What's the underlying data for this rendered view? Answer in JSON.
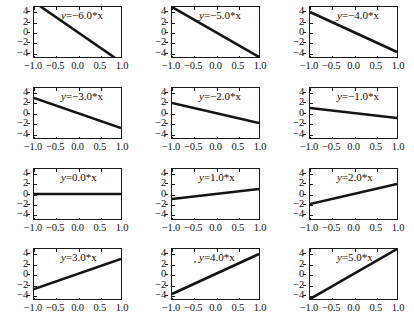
{
  "figure": {
    "rows": 4,
    "cols": 3,
    "background": "#ffffff",
    "line_color": "#141414",
    "axis_color": "#1a1a1a"
  },
  "axes_common": {
    "xlim": [
      -1.0,
      1.0
    ],
    "ylim": [
      -5.0,
      5.0
    ],
    "xticks": [
      -1.0,
      -0.5,
      0.0,
      0.5,
      1.0
    ],
    "xticklabels": [
      "-1.0",
      "-0.5",
      "0.0",
      "0.5",
      "1.0"
    ],
    "yticks": [
      -4,
      -2,
      0,
      2,
      4
    ],
    "yticklabels": [
      "-4",
      "-2",
      "0",
      "2",
      "4"
    ],
    "grid": false,
    "legend": false
  },
  "chart_data": [
    {
      "type": "line",
      "title": "y=−6.0*x",
      "label_eq_lhs": "y",
      "label_eq_op": "=",
      "label_eq_rhs": "−6.0*x",
      "slope": -6.0,
      "intercept": 0,
      "x": [
        -1.0,
        1.0
      ],
      "y": [
        6.0,
        -6.0
      ],
      "xlabel": "",
      "ylabel": "",
      "xlim": [
        -1.0,
        1.0
      ],
      "ylim": [
        -5.0,
        5.0
      ],
      "xticklabels": [
        "-1.0",
        "-0.5",
        "0.0",
        "0.5",
        "1.0"
      ],
      "yticklabels": [
        "-4",
        "-2",
        "0",
        "2",
        "4"
      ]
    },
    {
      "type": "line",
      "title": "y=−5.0*x",
      "label_eq_lhs": "y",
      "label_eq_op": "=",
      "label_eq_rhs": "−5.0*x",
      "slope": -5.0,
      "intercept": 0,
      "x": [
        -1.0,
        1.0
      ],
      "y": [
        5.0,
        -5.0
      ],
      "xlabel": "",
      "ylabel": "",
      "xlim": [
        -1.0,
        1.0
      ],
      "ylim": [
        -5.0,
        5.0
      ],
      "xticklabels": [
        "-1.0",
        "-0.5",
        "0.0",
        "0.5",
        "1.0"
      ],
      "yticklabels": [
        "-4",
        "-2",
        "0",
        "2",
        "4"
      ]
    },
    {
      "type": "line",
      "title": "y=−4.0*x",
      "label_eq_lhs": "y",
      "label_eq_op": "=",
      "label_eq_rhs": "−4.0*x",
      "slope": -4.0,
      "intercept": 0,
      "x": [
        -1.0,
        1.0
      ],
      "y": [
        4.0,
        -4.0
      ],
      "xlabel": "",
      "ylabel": "",
      "xlim": [
        -1.0,
        1.0
      ],
      "ylim": [
        -5.0,
        5.0
      ],
      "xticklabels": [
        "-1.0",
        "-0.5",
        "0.0",
        "0.5",
        "1.0"
      ],
      "yticklabels": [
        "-4",
        "-2",
        "0",
        "2",
        "4"
      ]
    },
    {
      "type": "line",
      "title": "y=−3.0*x",
      "label_eq_lhs": "y",
      "label_eq_op": "=",
      "label_eq_rhs": "−3.0*x",
      "slope": -3.0,
      "intercept": 0,
      "x": [
        -1.0,
        1.0
      ],
      "y": [
        3.0,
        -3.0
      ],
      "xlabel": "",
      "ylabel": "",
      "xlim": [
        -1.0,
        1.0
      ],
      "ylim": [
        -5.0,
        5.0
      ],
      "xticklabels": [
        "-1.0",
        "-0.5",
        "0.0",
        "0.5",
        "1.0"
      ],
      "yticklabels": [
        "-4",
        "-2",
        "0",
        "2",
        "4"
      ]
    },
    {
      "type": "line",
      "title": "y=−2.0*x",
      "label_eq_lhs": "y",
      "label_eq_op": "=",
      "label_eq_rhs": "−2.0*x",
      "slope": -2.0,
      "intercept": 0,
      "x": [
        -1.0,
        1.0
      ],
      "y": [
        2.0,
        -2.0
      ],
      "xlabel": "",
      "ylabel": "",
      "xlim": [
        -1.0,
        1.0
      ],
      "ylim": [
        -5.0,
        5.0
      ],
      "xticklabels": [
        "-1.0",
        "-0.5",
        "0.0",
        "0.5",
        "1.0"
      ],
      "yticklabels": [
        "-4",
        "-2",
        "0",
        "2",
        "4"
      ]
    },
    {
      "type": "line",
      "title": "y=−1.0*x",
      "label_eq_lhs": "y",
      "label_eq_op": "=",
      "label_eq_rhs": "−1.0*x",
      "slope": -1.0,
      "intercept": 0,
      "x": [
        -1.0,
        1.0
      ],
      "y": [
        1.0,
        -1.0
      ],
      "xlabel": "",
      "ylabel": "",
      "xlim": [
        -1.0,
        1.0
      ],
      "ylim": [
        -5.0,
        5.0
      ],
      "xticklabels": [
        "-1.0",
        "-0.5",
        "0.0",
        "0.5",
        "1.0"
      ],
      "yticklabels": [
        "-4",
        "-2",
        "0",
        "2",
        "4"
      ]
    },
    {
      "type": "line",
      "title": "y=0.0*x",
      "label_eq_lhs": "y",
      "label_eq_op": "=",
      "label_eq_rhs": "0.0*x",
      "slope": 0.0,
      "intercept": 0,
      "x": [
        -1.0,
        1.0
      ],
      "y": [
        0.0,
        0.0
      ],
      "xlabel": "",
      "ylabel": "",
      "xlim": [
        -1.0,
        1.0
      ],
      "ylim": [
        -5.0,
        5.0
      ],
      "xticklabels": [
        "-1.0",
        "-0.5",
        "0.0",
        "0.5",
        "1.0"
      ],
      "yticklabels": [
        "-4",
        "-2",
        "0",
        "2",
        "4"
      ]
    },
    {
      "type": "line",
      "title": "y=1.0*x",
      "label_eq_lhs": "y",
      "label_eq_op": "=",
      "label_eq_rhs": "1.0*x",
      "slope": 1.0,
      "intercept": 0,
      "x": [
        -1.0,
        1.0
      ],
      "y": [
        -1.0,
        1.0
      ],
      "xlabel": "",
      "ylabel": "",
      "xlim": [
        -1.0,
        1.0
      ],
      "ylim": [
        -5.0,
        5.0
      ],
      "xticklabels": [
        "-1.0",
        "-0.5",
        "0.0",
        "0.5",
        "1.0"
      ],
      "yticklabels": [
        "-4",
        "-2",
        "0",
        "2",
        "4"
      ]
    },
    {
      "type": "line",
      "title": "y=2.0*x",
      "label_eq_lhs": "y",
      "label_eq_op": "=",
      "label_eq_rhs": "2.0*x",
      "slope": 2.0,
      "intercept": 0,
      "x": [
        -1.0,
        1.0
      ],
      "y": [
        -2.0,
        2.0
      ],
      "xlabel": "",
      "ylabel": "",
      "xlim": [
        -1.0,
        1.0
      ],
      "ylim": [
        -5.0,
        5.0
      ],
      "xticklabels": [
        "-1.0",
        "-0.5",
        "0.0",
        "0.5",
        "1.0"
      ],
      "yticklabels": [
        "-4",
        "-2",
        "0",
        "2",
        "4"
      ]
    },
    {
      "type": "line",
      "title": "y=3.0*x",
      "label_eq_lhs": "y",
      "label_eq_op": "=",
      "label_eq_rhs": "3.0*x",
      "slope": 3.0,
      "intercept": 0,
      "x": [
        -1.0,
        1.0
      ],
      "y": [
        -3.0,
        3.0
      ],
      "xlabel": "",
      "ylabel": "",
      "xlim": [
        -1.0,
        1.0
      ],
      "ylim": [
        -5.0,
        5.0
      ],
      "xticklabels": [
        "-1.0",
        "-0.5",
        "0.0",
        "0.5",
        "1.0"
      ],
      "yticklabels": [
        "-4",
        "-2",
        "0",
        "2",
        "4"
      ]
    },
    {
      "type": "line",
      "title": "y=4.0*x",
      "label_eq_lhs": "y",
      "label_eq_op": "=",
      "label_eq_rhs": "4.0*x",
      "slope": 4.0,
      "intercept": 0,
      "x": [
        -1.0,
        1.0
      ],
      "y": [
        -4.0,
        4.0
      ],
      "xlabel": "",
      "ylabel": "",
      "xlim": [
        -1.0,
        1.0
      ],
      "ylim": [
        -5.0,
        5.0
      ],
      "xticklabels": [
        "-1.0",
        "-0.5",
        "0.0",
        "0.5",
        "1.0"
      ],
      "yticklabels": [
        "-4",
        "-2",
        "0",
        "2",
        "4"
      ]
    },
    {
      "type": "line",
      "title": "y=5.0*x",
      "label_eq_lhs": "y",
      "label_eq_op": "=",
      "label_eq_rhs": "5.0*x",
      "slope": 5.0,
      "intercept": 0,
      "x": [
        -1.0,
        1.0
      ],
      "y": [
        -5.0,
        5.0
      ],
      "xlabel": "",
      "ylabel": "",
      "xlim": [
        -1.0,
        1.0
      ],
      "ylim": [
        -5.0,
        5.0
      ],
      "xticklabels": [
        "-1.0",
        "-0.5",
        "0.0",
        "0.5",
        "1.0"
      ],
      "yticklabels": [
        "-4",
        "-2",
        "0",
        "2",
        "4"
      ]
    }
  ]
}
